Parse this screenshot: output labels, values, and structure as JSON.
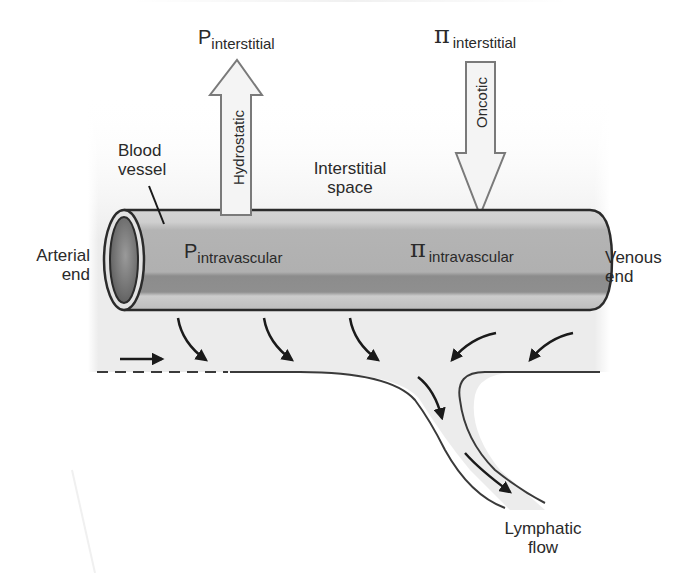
{
  "figure": {
    "topic": "Capillary fluid exchange (Starling forces)",
    "colors": {
      "interstitial_bg": "#ededed",
      "vessel_body": "#b3b3b3",
      "vessel_highlight": "#cfcfcf",
      "vessel_shadow": "#8f8f8f",
      "vessel_outline": "#2b2b2b",
      "arrow_fill": "#f4f4f4",
      "arrow_stroke": "#7a7a7a",
      "flow_arrow": "#1a1a1a"
    }
  },
  "labels": {
    "p_interstitial": {
      "symbol": "P",
      "subscript": "interstitial"
    },
    "pi_interstitial": {
      "symbol": "π",
      "subscript": "interstitial"
    },
    "p_intravascular": {
      "symbol": "P",
      "subscript": "intravascular"
    },
    "pi_intravascular": {
      "symbol": "π",
      "subscript": "intravascular"
    },
    "hydrostatic": "Hydrostatic",
    "oncotic": "Oncotic",
    "blood_vessel_line1": "Blood",
    "blood_vessel_line2": "vessel",
    "interstitial_space_line1": "Interstitial",
    "interstitial_space_line2": "space",
    "arterial_end_line1": "Arterial",
    "arterial_end_line2": "end",
    "venous_end_line1": "Venous",
    "venous_end_line2": "end",
    "lymphatic_flow_line1": "Lymphatic",
    "lymphatic_flow_line2": "flow"
  },
  "arrows": {
    "hydrostatic_direction": "outward",
    "oncotic_direction": "inward",
    "filtration_arrows_arterial_side": 3,
    "reabsorption_arrows_venous_side": 2,
    "lymph_arrows": 2
  }
}
